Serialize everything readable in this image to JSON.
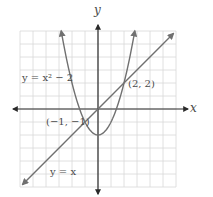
{
  "chart_data": {
    "type": "line",
    "title": "",
    "xlabel": "x",
    "ylabel": "y",
    "xlim": [
      -6,
      6
    ],
    "ylim": [
      -6,
      6
    ],
    "grid": true,
    "series": [
      {
        "name": "parabola",
        "label": "y = x² − 2",
        "equation": "y = x^2 - 2",
        "x_range": [
          -2.83,
          2.83
        ],
        "color": "#707070"
      },
      {
        "name": "line",
        "label": "y = x",
        "equation": "y = x",
        "x_range": [
          -5.8,
          5.8
        ],
        "color": "#707070"
      }
    ],
    "annotations": [
      {
        "label": "(2, 2)",
        "x": 2,
        "y": 2
      },
      {
        "label": "(−1, −1)",
        "x": -1,
        "y": -1
      }
    ],
    "colors": {
      "grid": "#d8d8d8",
      "axis": "#2a2a2a",
      "curve": "#707070",
      "text": "#4a4a4a"
    }
  }
}
